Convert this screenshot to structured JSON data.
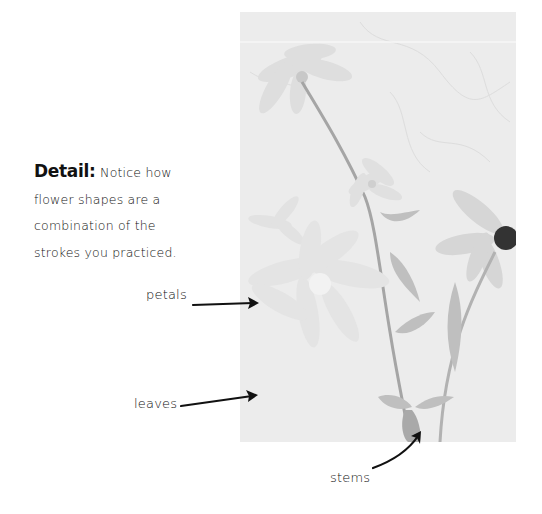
{
  "note": {
    "title": "Detail:",
    "lines": [
      "Notice how",
      "flower shapes are a",
      "combination of the",
      "strokes you practiced."
    ]
  },
  "labels": {
    "petals": "petals",
    "leaves": "leaves",
    "stems": "stems"
  },
  "photo": {
    "description": "Faded grayscale photograph of daisy-like flowers with stems and leaves",
    "background_color": "#ececec",
    "flower_center_color": "#333333"
  }
}
